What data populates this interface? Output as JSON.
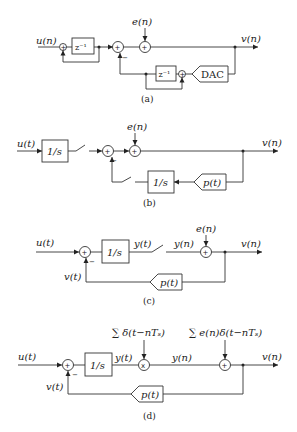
{
  "panels": {
    "a": {
      "caption": "(a)",
      "input": "u(n)",
      "noise": "e(n)",
      "output": "v(n)",
      "delay1": "z⁻¹",
      "delay2": "z⁻¹",
      "dac": "DAC",
      "sum_sign": "+",
      "minus": "−"
    },
    "b": {
      "caption": "(b)",
      "input": "u(t)",
      "noise": "e(n)",
      "output": "v(n)",
      "integrator1": "1/s",
      "integrator2": "1/s",
      "pulse": "p(t)",
      "sum_sign": "+",
      "minus": "−"
    },
    "c": {
      "caption": "(c)",
      "input": "u(t)",
      "noise": "e(n)",
      "output": "v(n)",
      "integrator": "1/s",
      "y_cont": "y(t)",
      "y_disc": "y(n)",
      "feedback": "v(t)",
      "pulse": "p(t)",
      "sum_sign": "+",
      "minus": "−"
    },
    "d": {
      "caption": "(d)",
      "input": "u(t)",
      "output": "v(n)",
      "integrator": "1/s",
      "y_cont": "y(t)",
      "y_disc": "y(n)",
      "feedback": "v(t)",
      "pulse": "p(t)",
      "sampler_label": "∑ δ(t−nTₛ)",
      "noise_label": "∑ e(n)δ(t−nTₛ)",
      "multiplier": "x",
      "sum_sign": "+",
      "minus": "−"
    }
  }
}
